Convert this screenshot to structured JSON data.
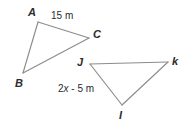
{
  "figure": {
    "background_color": "#ffffff",
    "stroke_color": "#8c8c8c",
    "label_color": "#2b2b2b",
    "triangles": [
      {
        "name": "triangle-abc",
        "vertices": [
          {
            "label": "A",
            "x": 38,
            "y": 20
          },
          {
            "label": "C",
            "x": 90,
            "y": 37
          },
          {
            "label": "B",
            "x": 22,
            "y": 76
          }
        ],
        "side_labels": [
          {
            "text": "15 m",
            "value": "15",
            "unit": "m",
            "between": "A-C"
          }
        ]
      },
      {
        "name": "triangle-jki",
        "vertices": [
          {
            "label": "J",
            "x": 89,
            "y": 63
          },
          {
            "label": "k",
            "x": 168,
            "y": 62
          },
          {
            "label": "I",
            "x": 121,
            "y": 108
          }
        ],
        "side_labels": [
          {
            "text": "2x - 5 m",
            "expression": "2x - 5",
            "unit": "m",
            "between": "J-I"
          }
        ]
      }
    ],
    "labels": {
      "a": "A",
      "b": "B",
      "c": "C",
      "j": "J",
      "k": "k",
      "i": "I",
      "side_ac": "15 m",
      "side_ji_prefix": "2",
      "side_ji_var": "x",
      "side_ji_suffix": " - 5 m"
    }
  }
}
